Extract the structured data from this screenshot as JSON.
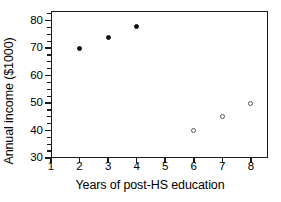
{
  "chart_data": {
    "type": "scatter",
    "title": "",
    "xlabel": "Years of post-HS education",
    "ylabel": "Annual income ($1000)",
    "xlim": [
      1,
      8.6
    ],
    "ylim": [
      30,
      83.5
    ],
    "xticks": [
      "1",
      "2",
      "3",
      "4",
      "5",
      "6",
      "7",
      "8"
    ],
    "xtick_values": [
      1,
      2,
      3,
      4,
      5,
      6,
      7,
      8
    ],
    "yticks": [
      "30",
      "40",
      "50",
      "60",
      "70",
      "80"
    ],
    "ytick_values": [
      30,
      40,
      50,
      60,
      70,
      80
    ],
    "y_minor_ticks": [
      32.5,
      35,
      37.5,
      42.5,
      45,
      47.5,
      52.5,
      55,
      57.5,
      62.5,
      65,
      67.5,
      72.5,
      75,
      77.5,
      82.5
    ],
    "grid": false,
    "legend": false,
    "series": [
      {
        "name": "filled",
        "marker": "filled-circle",
        "color": "#111111",
        "points": [
          {
            "x": 2,
            "y": 70
          },
          {
            "x": 3,
            "y": 74
          },
          {
            "x": 4,
            "y": 78
          }
        ]
      },
      {
        "name": "open",
        "marker": "open-circle",
        "color": "#555555",
        "points": [
          {
            "x": 6,
            "y": 40
          },
          {
            "x": 7,
            "y": 45
          },
          {
            "x": 8,
            "y": 50
          }
        ]
      }
    ]
  }
}
